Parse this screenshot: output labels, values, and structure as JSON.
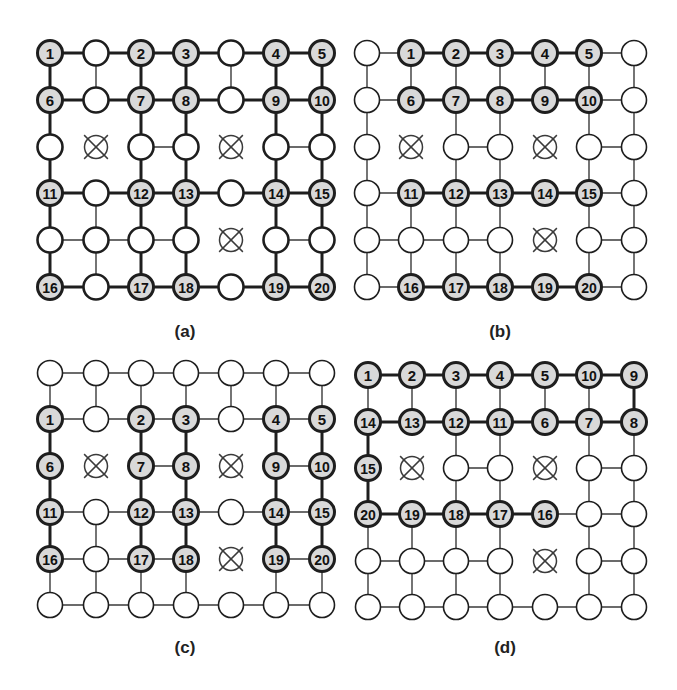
{
  "figure": {
    "width": 677,
    "height": 690,
    "colors": {
      "node_fill": "#ffffff",
      "highlight_fill": "#d9d9d9",
      "stroke": "#1e1e1e",
      "thin_edge": "#3a3a3a",
      "blocked": "#3a3a3a"
    },
    "grid": {
      "rows": 6,
      "cols": 7,
      "node_radius": 12.5
    },
    "panels": [
      {
        "id": "a",
        "label": "(a)",
        "label_pos": [
          185,
          332
        ],
        "col_x": [
          50,
          96,
          141,
          186,
          231,
          276,
          322
        ],
        "row_y": [
          53,
          100,
          147,
          193,
          240,
          287
        ],
        "blocked": [
          [
            2,
            1
          ],
          [
            2,
            4
          ],
          [
            4,
            4
          ]
        ],
        "numbers": [
          [
            "1",
            "",
            "2",
            "3",
            "",
            "4",
            "5"
          ],
          [
            "6",
            "",
            "7",
            "8",
            "",
            "9",
            "10"
          ],
          [
            "",
            "X",
            "",
            "",
            "X",
            "",
            ""
          ],
          [
            "11",
            "",
            "12",
            "13",
            "",
            "14",
            "15"
          ],
          [
            "",
            "",
            "",
            "",
            "X",
            "",
            ""
          ],
          [
            "16",
            "",
            "17",
            "18",
            "",
            "19",
            "20"
          ]
        ],
        "thick_rows": [
          0,
          1,
          3,
          5
        ],
        "thick_cols": [
          0,
          2,
          3,
          5,
          6
        ],
        "thick_mode": "rows_and_cols"
      },
      {
        "id": "b",
        "label": "(b)",
        "label_pos": [
          500,
          332
        ],
        "col_x": [
          367,
          411,
          456,
          500,
          545,
          589,
          634
        ],
        "row_y": [
          53,
          100,
          147,
          193,
          240,
          287
        ],
        "blocked": [
          [
            2,
            1
          ],
          [
            2,
            4
          ],
          [
            4,
            4
          ]
        ],
        "numbers": [
          [
            "",
            "1",
            "2",
            "3",
            "4",
            "5",
            ""
          ],
          [
            "",
            "6",
            "7",
            "8",
            "9",
            "10",
            ""
          ],
          [
            "",
            "X",
            "",
            "",
            "X",
            "",
            ""
          ],
          [
            "",
            "11",
            "12",
            "13",
            "14",
            "15",
            ""
          ],
          [
            "",
            "",
            "",
            "",
            "X",
            "",
            ""
          ],
          [
            "",
            "16",
            "17",
            "18",
            "19",
            "20",
            ""
          ]
        ],
        "thick_mode": "horizontal_between_numbered"
      },
      {
        "id": "c",
        "label": "(c)",
        "label_pos": [
          185,
          648
        ],
        "col_x": [
          50,
          96,
          141,
          186,
          231,
          276,
          322
        ],
        "row_y": [
          373,
          419,
          466,
          512,
          559,
          605
        ],
        "blocked": [
          [
            2,
            1
          ],
          [
            2,
            4
          ],
          [
            4,
            4
          ]
        ],
        "numbers": [
          [
            "",
            "",
            "",
            "",
            "",
            "",
            ""
          ],
          [
            "1",
            "",
            "2",
            "3",
            "",
            "4",
            "5"
          ],
          [
            "6",
            "X",
            "7",
            "8",
            "X",
            "9",
            "10"
          ],
          [
            "11",
            "",
            "12",
            "13",
            "",
            "14",
            "15"
          ],
          [
            "16",
            "",
            "17",
            "18",
            "X",
            "19",
            "20"
          ],
          [
            "",
            "",
            "",
            "",
            "",
            "",
            ""
          ]
        ],
        "thick_mode": "vertical_between_numbered"
      },
      {
        "id": "d",
        "label": "(d)",
        "label_pos": [
          505,
          648
        ],
        "col_x": [
          368,
          412,
          456,
          500,
          545,
          589,
          634
        ],
        "row_y": [
          375,
          422,
          468,
          514,
          561,
          607
        ],
        "blocked": [
          [
            2,
            1
          ],
          [
            2,
            4
          ],
          [
            4,
            4
          ]
        ],
        "numbers": [
          [
            "1",
            "2",
            "3",
            "4",
            "5",
            "10",
            "9"
          ],
          [
            "14",
            "13",
            "12",
            "11",
            "6",
            "7",
            "8"
          ],
          [
            "15",
            "X",
            "",
            "",
            "X",
            "",
            ""
          ],
          [
            "20",
            "19",
            "18",
            "17",
            "16",
            "",
            ""
          ],
          [
            "",
            "",
            "",
            "",
            "X",
            "",
            ""
          ],
          [
            "",
            "",
            "",
            "",
            "",
            "",
            ""
          ]
        ],
        "path": [
          "1",
          "2",
          "3",
          "4",
          "5",
          "10",
          "9",
          "8",
          "7",
          "6",
          "11",
          "12",
          "13",
          "14",
          "15",
          "20",
          "19",
          "18",
          "17",
          "16"
        ],
        "thick_mode": "path"
      }
    ]
  }
}
